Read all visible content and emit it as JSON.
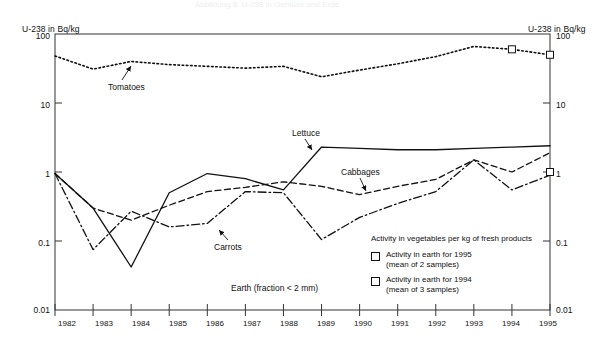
{
  "faint_title": "Abbildung 8: U-238 in Gemüse und Erde",
  "axes": {
    "left_title": "U-238 in Bq/kg",
    "right_title": "U-238 in Bq/kg",
    "y_ticks": [
      "100",
      "10",
      "1",
      "0.1",
      "0.01"
    ],
    "x_ticks": [
      "1982",
      "1983",
      "1984",
      "1985",
      "1986",
      "1987",
      "1988",
      "1989",
      "1990",
      "1991",
      "1992",
      "1993",
      "1994",
      "1995"
    ]
  },
  "annotations": {
    "tomatoes": "Tomatoes",
    "lettuce": "Lettuce",
    "cabbages": "Cabbages",
    "carrots": "Carrots",
    "earth": "Earth (fraction < 2 mm)"
  },
  "legend": {
    "caption": "Activity in vegetables per kg of fresh products",
    "entry1_line1": "Activity in earth for 1995",
    "entry1_line2": "(mean of 2 samples)",
    "entry2_line1": "Activity in earth for 1994",
    "entry2_line2": "(mean of 3 samples)"
  },
  "colors": {
    "line": "#111111",
    "frame": "#333333",
    "background": "#ffffff"
  },
  "chart_data": {
    "type": "line",
    "xlabel": "",
    "ylabel": "U-238 in Bq/kg",
    "yscale": "log",
    "ylim": [
      0.01,
      100
    ],
    "xlim": [
      1982,
      1995
    ],
    "grid": false,
    "legend_position": "inside-lower-right",
    "x": [
      1982,
      1983,
      1984,
      1985,
      1986,
      1987,
      1988,
      1989,
      1990,
      1991,
      1992,
      1993,
      1994,
      1995
    ],
    "series": [
      {
        "name": "Earth (fraction < 2 mm)",
        "style": "dotted",
        "marker": "none",
        "values": [
          48,
          31,
          40,
          36,
          34,
          32,
          34,
          24,
          30,
          37,
          47,
          66,
          60,
          50
        ]
      },
      {
        "name": "Lettuce",
        "style": "solid",
        "marker": "none",
        "values": [
          0.95,
          0.3,
          0.042,
          0.5,
          0.95,
          0.8,
          0.55,
          2.3,
          2.2,
          2.1,
          2.1,
          2.2,
          2.3,
          2.4
        ]
      },
      {
        "name": "Cabbages",
        "style": "dashed",
        "marker": "none",
        "values": [
          0.95,
          0.3,
          0.2,
          0.33,
          0.52,
          0.6,
          0.72,
          0.62,
          0.47,
          0.62,
          0.78,
          1.5,
          1.0,
          1.9
        ]
      },
      {
        "name": "Carrots",
        "style": "dashdot",
        "marker": "none",
        "values": [
          0.95,
          0.075,
          0.27,
          0.16,
          0.18,
          0.52,
          0.5,
          0.105,
          0.22,
          0.35,
          0.52,
          1.5,
          0.55,
          0.9
        ]
      }
    ],
    "earth_markers_1994": [
      {
        "x": 1994,
        "y": 60
      }
    ],
    "earth_markers_1995": [
      {
        "x": 1995,
        "y": 50
      },
      {
        "x": 1995,
        "y": 1.0
      }
    ]
  }
}
